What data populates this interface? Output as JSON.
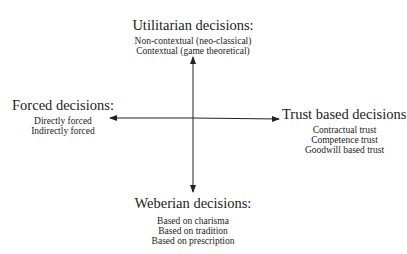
{
  "diagram": {
    "top": {
      "title": "Utilitarian decisions:",
      "items": [
        "Non-contextual (neo-classical)",
        "Contextual (game theoretical)"
      ]
    },
    "left": {
      "title": "Forced decisions:",
      "items": [
        "Directly forced",
        "Indirectly forced"
      ]
    },
    "right": {
      "title": "Trust based decisions:",
      "items": [
        "Contractual trust",
        "Competence trust",
        "Goodwill based trust"
      ]
    },
    "bottom": {
      "title": "Weberian decisions:",
      "items": [
        "Based on charisma",
        "Based on tradition",
        "Based on prescription"
      ]
    },
    "colors": {
      "line": "#222222",
      "text": "#222222",
      "background": "#ffffff"
    }
  }
}
